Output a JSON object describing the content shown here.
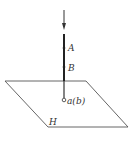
{
  "diagram": {
    "labels": {
      "point_a": "A",
      "point_b": "B",
      "projection": "a(b)",
      "plane": "H"
    },
    "colors": {
      "line": "#333333",
      "plane": "#555555",
      "background": "#ffffff"
    }
  }
}
